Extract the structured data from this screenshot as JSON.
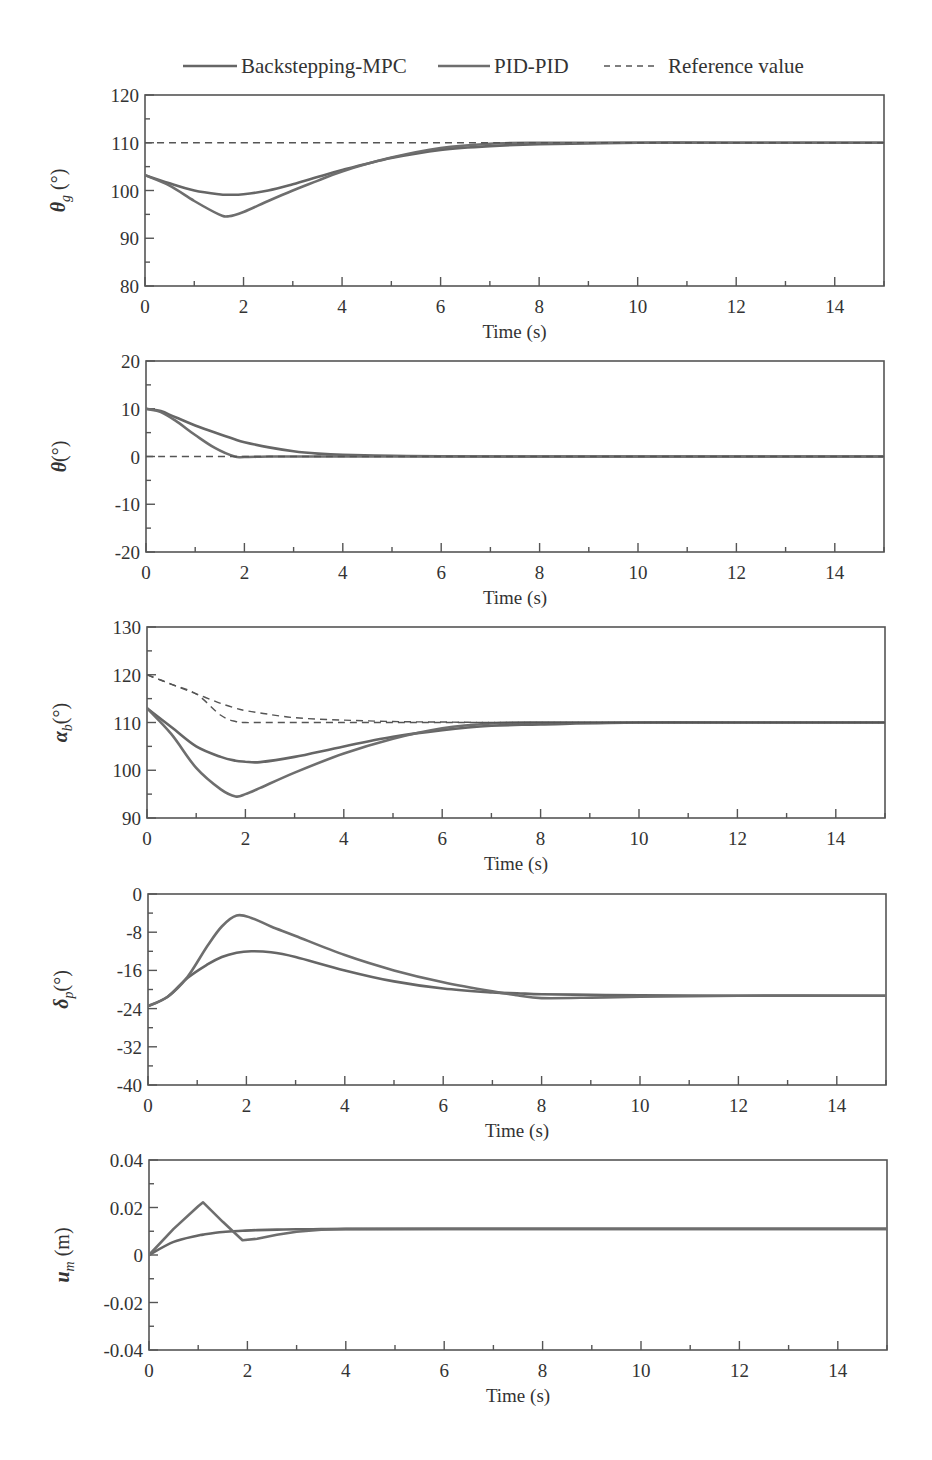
{
  "legend": {
    "items": [
      {
        "label": "Backstepping-MPC",
        "style": "solid",
        "color": "#666666"
      },
      {
        "label": "PID-PID",
        "style": "solid",
        "color": "#6e6e6e"
      },
      {
        "label": "Reference value",
        "style": "dashed",
        "color": "#555555"
      }
    ]
  },
  "chart_data": [
    {
      "type": "line",
      "title": "",
      "xlabel": "Time (s)",
      "ylabel": "θg (°)",
      "xlim": [
        0,
        15
      ],
      "ylim": [
        80,
        120
      ],
      "xticks": [
        "0",
        "2",
        "4",
        "6",
        "8",
        "10",
        "12",
        "14"
      ],
      "yticks": [
        "80",
        "90",
        "100",
        "110",
        "120"
      ],
      "grid": false,
      "x": [
        0,
        0.5,
        1,
        1.5,
        1.7,
        2,
        2.5,
        3,
        3.5,
        4,
        5,
        6,
        7,
        8,
        10,
        12,
        15
      ],
      "series": [
        {
          "name": "Backstepping-MPC",
          "values": [
            103.2,
            101.5,
            100.0,
            99.2,
            99.1,
            99.2,
            100.0,
            101.3,
            102.8,
            104.3,
            106.8,
            108.5,
            109.3,
            109.7,
            110.0,
            110.0,
            110.0
          ]
        },
        {
          "name": "PID-PID",
          "values": [
            103.2,
            101.0,
            97.8,
            95.0,
            94.6,
            95.5,
            97.8,
            100.0,
            102.0,
            104.0,
            106.9,
            108.9,
            109.8,
            110.0,
            110.0,
            110.0,
            110.0
          ]
        },
        {
          "name": "Reference value",
          "values": [
            110,
            110,
            110,
            110,
            110,
            110,
            110,
            110,
            110,
            110,
            110,
            110,
            110,
            110,
            110,
            110,
            110
          ]
        }
      ]
    },
    {
      "type": "line",
      "title": "",
      "xlabel": "Time (s)",
      "ylabel": "θ(°)",
      "xlim": [
        0,
        15
      ],
      "ylim": [
        -20,
        20
      ],
      "xticks": [
        "0",
        "2",
        "4",
        "6",
        "8",
        "10",
        "12",
        "14"
      ],
      "yticks": [
        "-20",
        "-10",
        "0",
        "10",
        "20"
      ],
      "grid": false,
      "x": [
        0,
        0.3,
        0.6,
        1,
        1.4,
        1.8,
        2,
        2.5,
        3,
        3.5,
        4,
        5,
        6,
        8,
        10,
        15
      ],
      "series": [
        {
          "name": "Backstepping-MPC",
          "values": [
            10,
            9.5,
            8.2,
            6.5,
            5.0,
            3.6,
            3.0,
            1.9,
            1.1,
            0.6,
            0.35,
            0.15,
            0.05,
            0,
            0,
            0
          ]
        },
        {
          "name": "PID-PID",
          "values": [
            10,
            9.3,
            7.5,
            4.5,
            1.8,
            0,
            -0.1,
            0,
            0,
            0,
            0,
            0,
            0,
            0,
            0,
            0
          ]
        },
        {
          "name": "Reference value",
          "values": [
            0,
            0,
            0,
            0,
            0,
            0,
            0,
            0,
            0,
            0,
            0,
            0,
            0,
            0,
            0,
            0
          ]
        }
      ]
    },
    {
      "type": "line",
      "title": "",
      "xlabel": "Time (s)",
      "ylabel": "αb(°)",
      "xlim": [
        0,
        15
      ],
      "ylim": [
        90,
        130
      ],
      "xticks": [
        "0",
        "2",
        "4",
        "6",
        "8",
        "10",
        "12",
        "14"
      ],
      "yticks": [
        "90",
        "100",
        "110",
        "120",
        "130"
      ],
      "grid": false,
      "x": [
        0,
        0.5,
        1,
        1.5,
        1.8,
        2,
        2.3,
        3,
        4,
        5,
        6,
        7,
        8,
        10,
        12,
        15
      ],
      "series": [
        {
          "name": "Backstepping-MPC",
          "values": [
            113,
            109,
            105,
            102.8,
            102.0,
            101.8,
            101.7,
            102.8,
            105.0,
            107.0,
            108.4,
            109.3,
            109.6,
            110.0,
            110.0,
            110.0
          ]
        },
        {
          "name": "PID-PID",
          "values": [
            113,
            107.5,
            100.5,
            96.0,
            94.5,
            95.0,
            96.3,
            99.5,
            103.5,
            106.6,
            108.8,
            109.8,
            110.0,
            110.0,
            110.0,
            110.0
          ]
        },
        {
          "name": "Reference value (Backstepping-MPC)",
          "values": [
            120,
            118,
            116,
            114,
            113,
            112.5,
            112,
            111,
            110.5,
            110.2,
            110.1,
            110,
            110,
            110,
            110,
            110
          ]
        },
        {
          "name": "Reference value (PID-PID)",
          "values": [
            120,
            118,
            116,
            111.5,
            110.2,
            110,
            110,
            110,
            110,
            110,
            110,
            110,
            110,
            110,
            110,
            110
          ]
        }
      ]
    },
    {
      "type": "line",
      "title": "",
      "xlabel": "Time (s)",
      "ylabel": "δp(°)",
      "xlim": [
        0,
        15
      ],
      "ylim": [
        -40,
        0
      ],
      "xticks": [
        "0",
        "2",
        "4",
        "6",
        "8",
        "10",
        "12",
        "14"
      ],
      "yticks": [
        "-40",
        "-32",
        "-24",
        "-16",
        "-8",
        "0"
      ],
      "grid": false,
      "x": [
        0,
        0.4,
        0.8,
        1.2,
        1.5,
        1.8,
        2.1,
        2.5,
        3,
        4,
        5,
        6,
        7,
        7.5,
        8,
        9,
        10,
        12,
        15
      ],
      "series": [
        {
          "name": "Backstepping-MPC",
          "values": [
            -23.5,
            -21.5,
            -17.6,
            -14.8,
            -13.2,
            -12.3,
            -12.0,
            -12.2,
            -13.2,
            -16.0,
            -18.3,
            -19.8,
            -20.6,
            -20.8,
            -21.0,
            -21.1,
            -21.2,
            -21.3,
            -21.3
          ]
        },
        {
          "name": "PID-PID",
          "values": [
            -23.5,
            -21.5,
            -17.4,
            -11.0,
            -6.8,
            -4.5,
            -5.0,
            -6.8,
            -8.8,
            -12.8,
            -16.0,
            -18.5,
            -20.4,
            -21.2,
            -21.8,
            -21.7,
            -21.5,
            -21.3,
            -21.3
          ]
        }
      ]
    },
    {
      "type": "line",
      "title": "",
      "xlabel": "Time (s)",
      "ylabel": "um (m)",
      "xlim": [
        0,
        15
      ],
      "ylim": [
        -0.04,
        0.04
      ],
      "xticks": [
        "0",
        "2",
        "4",
        "6",
        "8",
        "10",
        "12",
        "14"
      ],
      "yticks": [
        "-0.04",
        "-0.02",
        "0",
        "0.02",
        "0.04"
      ],
      "grid": false,
      "x": [
        0,
        0.5,
        1,
        1.1,
        1.5,
        1.9,
        2.2,
        2.6,
        3,
        3.5,
        4,
        6,
        8,
        10,
        15
      ],
      "series": [
        {
          "name": "Backstepping-MPC",
          "values": [
            0,
            0.0055,
            0.0082,
            0.0086,
            0.0097,
            0.0102,
            0.0105,
            0.0107,
            0.0108,
            0.0109,
            0.011,
            0.011,
            0.011,
            0.011,
            0.011
          ]
        },
        {
          "name": "PID-PID",
          "values": [
            0,
            0.011,
            0.0205,
            0.0222,
            0.014,
            0.0062,
            0.0068,
            0.0085,
            0.0098,
            0.0106,
            0.0109,
            0.011,
            0.011,
            0.011,
            0.011
          ]
        }
      ]
    }
  ],
  "panels": [
    {
      "ylabel_main": "θ",
      "ylabel_sub": "g",
      "ylabel_unit": " (°)",
      "xlabel": "Time (s)"
    },
    {
      "ylabel_main": "θ",
      "ylabel_sub": "",
      "ylabel_unit": "(°)",
      "xlabel": "Time (s)"
    },
    {
      "ylabel_main": "α",
      "ylabel_sub": "b",
      "ylabel_unit": "(°)",
      "xlabel": "Time (s)"
    },
    {
      "ylabel_main": "δ",
      "ylabel_sub": "p",
      "ylabel_unit": "(°)",
      "xlabel": "Time (s)"
    },
    {
      "ylabel_main": "u",
      "ylabel_sub": "m",
      "ylabel_unit": " (m)",
      "xlabel": "Time (s)"
    }
  ]
}
